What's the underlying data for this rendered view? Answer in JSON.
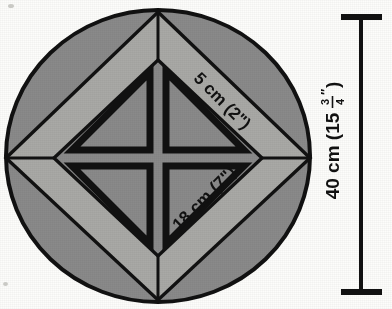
{
  "figure": {
    "shape": "circle-with-inscribed-diamond"
  },
  "labels": {
    "band_label": "5 cm (2\")",
    "diamond_side_label": "18 cm (7\")",
    "diameter_whole": "40 cm (15",
    "diameter_fraction_numerator": "3",
    "diameter_fraction_denominator": "4",
    "diameter_inch_mark": "″",
    "diameter_close": ")"
  },
  "measurements": {
    "band_width_cm": 5,
    "band_width_in": 2,
    "diamond_side_cm": 18,
    "diamond_side_in": 7,
    "diameter_cm": 40,
    "diameter_in": 15.75
  },
  "colors": {
    "outer_ring_gray": "#8a8a8a",
    "light_band_gray": "#a9a9a6",
    "inner_panel_gray": "#8a8a8a",
    "outline_black": "#111111",
    "page_background": "#fdfdfb"
  },
  "dimension_line": {
    "orientation": "vertical",
    "cap_style": "flat-tee",
    "label": "40 cm (15¾″)"
  }
}
